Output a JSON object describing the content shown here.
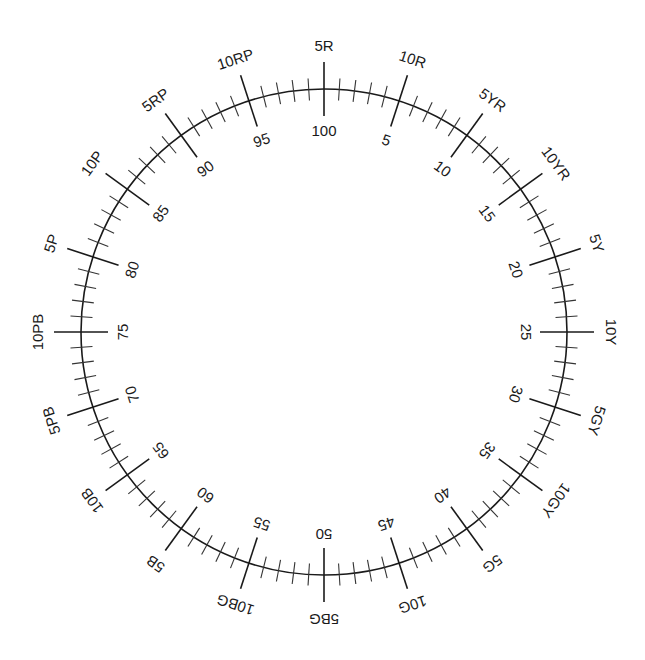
{
  "diagram": {
    "geometry": {
      "center_x": 324,
      "center_y": 332,
      "radius": 243,
      "major_tick_half_length": 27,
      "minor_tick_half_length": 11,
      "outer_label_radius": 287,
      "inner_label_radius": 202,
      "divisions": 100,
      "major_every": 5
    },
    "colors": {
      "line": "#1a1a1a",
      "text": "#1a1a1a",
      "background": "#ffffff"
    },
    "hue_labels": [
      "5R",
      "10R",
      "5YR",
      "10YR",
      "5Y",
      "10Y",
      "5GY",
      "10GY",
      "5G",
      "10G",
      "5BG",
      "10BG",
      "5B",
      "10B",
      "5PB",
      "10PB",
      "5P",
      "10P",
      "5RP",
      "10RP"
    ],
    "number_labels": [
      "5",
      "10",
      "15",
      "20",
      "25",
      "30",
      "35",
      "40",
      "45",
      "50",
      "55",
      "60",
      "65",
      "70",
      "75",
      "80",
      "85",
      "90",
      "95",
      "100"
    ]
  }
}
